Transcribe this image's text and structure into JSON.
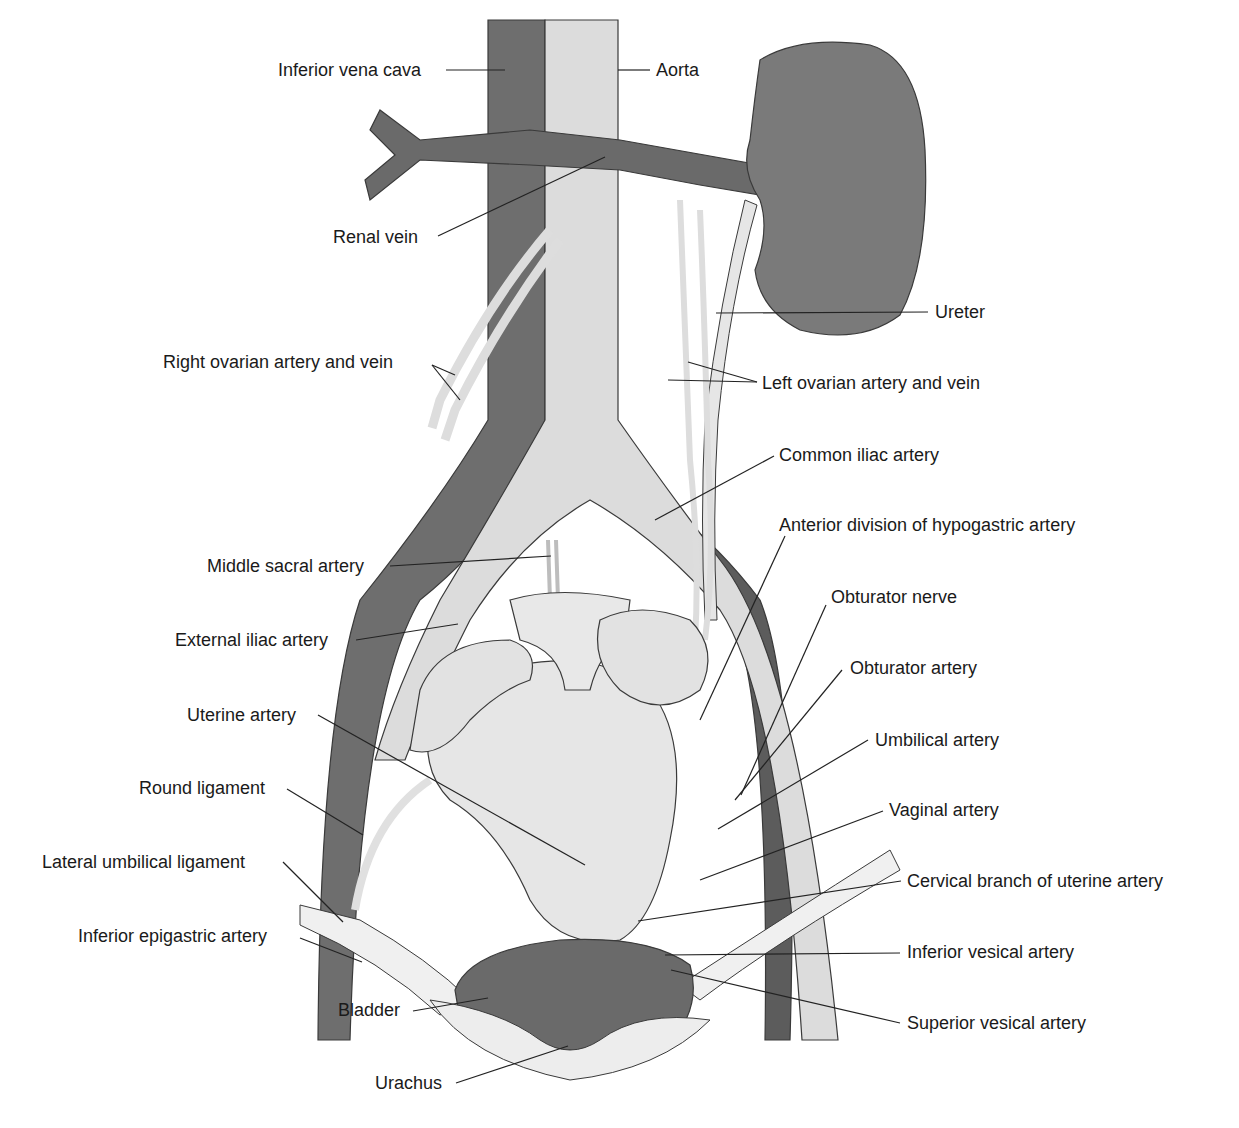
{
  "figure": {
    "caption": "",
    "colors": {
      "vein": "#6e6e6e",
      "vein_dark": "#555555",
      "artery": "#d6d6d6",
      "artery_light": "#ececec",
      "kidney": "#7a7a7a",
      "organ": "#e4e4e4",
      "bladder": "#6a6a6a",
      "outline": "#3a3a3a",
      "leader": "#222222"
    },
    "labels": [
      {
        "id": "inferior-vena-cava",
        "text": "Inferior vena cava",
        "x": 278,
        "y": 60
      },
      {
        "id": "aorta",
        "text": "Aorta",
        "x": 656,
        "y": 60
      },
      {
        "id": "renal-vein",
        "text": "Renal vein",
        "x": 333,
        "y": 227
      },
      {
        "id": "ureter",
        "text": "Ureter",
        "x": 935,
        "y": 302
      },
      {
        "id": "right-ovarian-artery-and-vein",
        "text": "Right ovarian artery and vein",
        "x": 163,
        "y": 352
      },
      {
        "id": "left-ovarian-artery-and-vein",
        "text": "Left ovarian artery and vein",
        "x": 762,
        "y": 373
      },
      {
        "id": "common-iliac-artery",
        "text": "Common iliac artery",
        "x": 779,
        "y": 445
      },
      {
        "id": "anterior-division-hypogastric-artery",
        "text": "Anterior division of hypogastric artery",
        "x": 779,
        "y": 515
      },
      {
        "id": "middle-sacral-artery",
        "text": "Middle sacral artery",
        "x": 207,
        "y": 556
      },
      {
        "id": "obturator-nerve",
        "text": "Obturator nerve",
        "x": 831,
        "y": 587
      },
      {
        "id": "external-iliac-artery",
        "text": "External iliac artery",
        "x": 175,
        "y": 630
      },
      {
        "id": "obturator-artery",
        "text": "Obturator artery",
        "x": 850,
        "y": 658
      },
      {
        "id": "uterine-artery",
        "text": "Uterine artery",
        "x": 187,
        "y": 705
      },
      {
        "id": "umbilical-artery",
        "text": "Umbilical artery",
        "x": 875,
        "y": 730
      },
      {
        "id": "round-ligament",
        "text": "Round ligament",
        "x": 139,
        "y": 778
      },
      {
        "id": "vaginal-artery",
        "text": "Vaginal artery",
        "x": 889,
        "y": 800
      },
      {
        "id": "lateral-umbilical-ligament",
        "text": "Lateral umbilical ligament",
        "x": 42,
        "y": 852
      },
      {
        "id": "cervical-branch-uterine-artery",
        "text": "Cervical branch of uterine artery",
        "x": 907,
        "y": 871
      },
      {
        "id": "inferior-epigastric-artery",
        "text": "Inferior epigastric artery",
        "x": 78,
        "y": 926
      },
      {
        "id": "inferior-vesical-artery",
        "text": "Inferior vesical artery",
        "x": 907,
        "y": 942
      },
      {
        "id": "bladder",
        "text": "Bladder",
        "x": 338,
        "y": 1000
      },
      {
        "id": "superior-vesical-artery",
        "text": "Superior vesical artery",
        "x": 907,
        "y": 1013
      },
      {
        "id": "urachus",
        "text": "Urachus",
        "x": 375,
        "y": 1073
      }
    ],
    "leaders": [
      {
        "id": "inferior-vena-cava",
        "x1": 446,
        "y1": 70,
        "x2": 505,
        "y2": 70
      },
      {
        "id": "aorta",
        "x1": 650,
        "y1": 70,
        "x2": 618,
        "y2": 70
      },
      {
        "id": "renal-vein",
        "x1": 438,
        "y1": 236,
        "x2": 605,
        "y2": 157
      },
      {
        "id": "ureter",
        "x1": 928,
        "y1": 312,
        "x2": 716,
        "y2": 313
      },
      {
        "id": "right-ovarian-a",
        "x1": 432,
        "y1": 365,
        "x2": 455,
        "y2": 375
      },
      {
        "id": "right-ovarian-b",
        "x1": 432,
        "y1": 365,
        "x2": 460,
        "y2": 400
      },
      {
        "id": "left-ovarian-a",
        "x1": 757,
        "y1": 382,
        "x2": 688,
        "y2": 362
      },
      {
        "id": "left-ovarian-b",
        "x1": 757,
        "y1": 382,
        "x2": 668,
        "y2": 380
      },
      {
        "id": "common-iliac-artery",
        "x1": 774,
        "y1": 456,
        "x2": 655,
        "y2": 520
      },
      {
        "id": "anterior-division",
        "x1": 785,
        "y1": 536,
        "x2": 700,
        "y2": 720
      },
      {
        "id": "middle-sacral-artery",
        "x1": 390,
        "y1": 566,
        "x2": 551,
        "y2": 556
      },
      {
        "id": "obturator-nerve",
        "x1": 826,
        "y1": 605,
        "x2": 741,
        "y2": 795
      },
      {
        "id": "external-iliac-artery",
        "x1": 356,
        "y1": 640,
        "x2": 458,
        "y2": 624
      },
      {
        "id": "obturator-artery",
        "x1": 842,
        "y1": 670,
        "x2": 735,
        "y2": 800
      },
      {
        "id": "uterine-artery",
        "x1": 318,
        "y1": 715,
        "x2": 585,
        "y2": 865
      },
      {
        "id": "umbilical-artery",
        "x1": 868,
        "y1": 740,
        "x2": 718,
        "y2": 829
      },
      {
        "id": "round-ligament",
        "x1": 287,
        "y1": 789,
        "x2": 363,
        "y2": 835
      },
      {
        "id": "vaginal-artery",
        "x1": 883,
        "y1": 811,
        "x2": 700,
        "y2": 880
      },
      {
        "id": "lateral-umbilical-ligament",
        "x1": 283,
        "y1": 862,
        "x2": 343,
        "y2": 922
      },
      {
        "id": "cervical-branch",
        "x1": 901,
        "y1": 881,
        "x2": 638,
        "y2": 921
      },
      {
        "id": "inferior-epigastric-artery",
        "x1": 300,
        "y1": 938,
        "x2": 362,
        "y2": 962
      },
      {
        "id": "inferior-vesical-artery",
        "x1": 900,
        "y1": 953,
        "x2": 665,
        "y2": 955
      },
      {
        "id": "bladder",
        "x1": 413,
        "y1": 1011,
        "x2": 488,
        "y2": 998
      },
      {
        "id": "superior-vesical-artery",
        "x1": 900,
        "y1": 1023,
        "x2": 671,
        "y2": 970
      },
      {
        "id": "urachus",
        "x1": 456,
        "y1": 1083,
        "x2": 568,
        "y2": 1046
      }
    ]
  }
}
